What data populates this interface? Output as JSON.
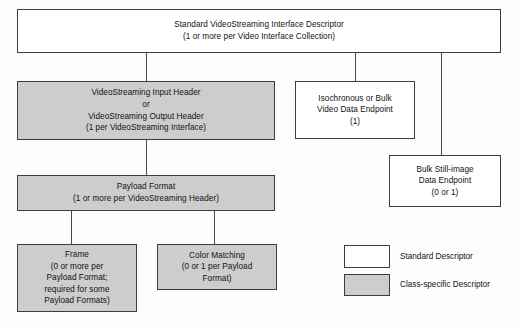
{
  "diagram": {
    "colors": {
      "standard_descriptor_fill": "#ffffff",
      "class_specific_descriptor_fill": "#cdcdcd",
      "border": "#3c3c3c",
      "connector": "#4a4a4a",
      "background": "#fdfdfd",
      "text": "#111111"
    },
    "nodes": [
      {
        "id": "vs-interface-descriptor",
        "type": "standard",
        "lines": [
          "Standard VideoStreaming Interface Descriptor",
          "(1 or more per Video Interface Collection)"
        ]
      },
      {
        "id": "vs-header",
        "type": "class-specific",
        "lines": [
          "VideoStreaming Input Header",
          "or",
          "VideoStreaming Output Header",
          "(1 per VideoStreaming Interface)"
        ]
      },
      {
        "id": "video-data-endpoint",
        "type": "standard",
        "lines": [
          "Isochronous or Bulk",
          "Video Data Endpoint",
          "(1)"
        ]
      },
      {
        "id": "still-image-endpoint",
        "type": "standard",
        "lines": [
          "Bulk Still-image",
          "Data Endpoint",
          "(0 or 1)"
        ]
      },
      {
        "id": "payload-format",
        "type": "class-specific",
        "lines": [
          "Payload Format",
          "(1 or more per VideoStreaming Header)"
        ]
      },
      {
        "id": "frame",
        "type": "class-specific",
        "lines": [
          "Frame",
          "(0 or more per",
          "Payload Format;",
          "required for some",
          "Payload Formats)"
        ]
      },
      {
        "id": "color-matching",
        "type": "class-specific",
        "lines": [
          "Color Matching",
          "(0 or 1 per Payload",
          "Format)"
        ]
      }
    ],
    "legend": {
      "items": [
        {
          "id": "standard",
          "label": "Standard Descriptor",
          "fill": "#ffffff"
        },
        {
          "id": "class-specific",
          "label": "Class-specific Descriptor",
          "fill": "#cdcdcd"
        }
      ]
    }
  }
}
